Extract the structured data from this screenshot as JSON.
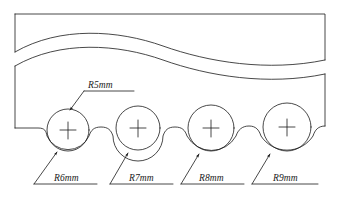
{
  "drawing": {
    "title": "Scalloped wave band radius callout drawing",
    "type": "engineering-line-drawing",
    "background_color": "#ffffff",
    "line_color": "#1a1a1a",
    "line_width": 0.8,
    "canvas": {
      "width": 340,
      "height": 204
    }
  },
  "annotations": [
    {
      "id": "r5",
      "label_prefix": "R",
      "label_value": "5",
      "label_unit": "mm",
      "label": "R5mm",
      "text_x": 88,
      "text_y": 88,
      "underline": {
        "x1": 84,
        "y1": 91,
        "x2": 134,
        "y2": 91
      },
      "leader": {
        "x1": 84,
        "y1": 91,
        "x2": 70,
        "y2": 108
      },
      "arrow": {
        "x": 70,
        "y": 108,
        "angle": 230
      },
      "points_to": "construction-circle-1"
    },
    {
      "id": "r6",
      "label_prefix": "R",
      "label_value": "6",
      "label_unit": "mm",
      "label": "R6mm",
      "text_x": 54,
      "text_y": 180,
      "underline": {
        "x1": 34,
        "y1": 184,
        "x2": 97,
        "y2": 184
      },
      "leader": {
        "x1": 34,
        "y1": 184,
        "x2": 57,
        "y2": 153
      },
      "arrow": {
        "x": 57,
        "y": 153,
        "angle": 307
      },
      "points_to": "scallop-arc-1"
    },
    {
      "id": "r7",
      "label_prefix": "R",
      "label_value": "7",
      "label_unit": "mm",
      "label": "R7mm",
      "text_x": 129,
      "text_y": 180,
      "underline": {
        "x1": 110,
        "y1": 184,
        "x2": 173,
        "y2": 184
      },
      "leader": {
        "x1": 110,
        "y1": 184,
        "x2": 128,
        "y2": 154
      },
      "arrow": {
        "x": 128,
        "y": 154,
        "angle": 301
      },
      "points_to": "scallop-arc-2"
    },
    {
      "id": "r8",
      "label_prefix": "R",
      "label_value": "8",
      "label_unit": "mm",
      "label": "R8mm",
      "text_x": 199,
      "text_y": 180,
      "underline": {
        "x1": 181,
        "y1": 184,
        "x2": 244,
        "y2": 184
      },
      "leader": {
        "x1": 181,
        "y1": 184,
        "x2": 197,
        "y2": 155
      },
      "arrow": {
        "x": 197,
        "y": 155,
        "angle": 299
      },
      "points_to": "scallop-arc-3"
    },
    {
      "id": "r9",
      "label_prefix": "R",
      "label_value": "9",
      "label_unit": "mm",
      "label": "R9mm",
      "text_x": 273,
      "text_y": 180,
      "underline": {
        "x1": 252,
        "y1": 184,
        "x2": 318,
        "y2": 184
      },
      "leader": {
        "x1": 252,
        "y1": 184,
        "x2": 268,
        "y2": 155
      },
      "arrow": {
        "x": 268,
        "y": 155,
        "angle": 299
      },
      "points_to": "scallop-arc-4"
    }
  ],
  "teeth": [
    {
      "id": 1,
      "center_x": 68,
      "center_y": 130,
      "circle_r": 21,
      "scallop_r": 23,
      "cross_size": 12
    },
    {
      "id": 2,
      "center_x": 138,
      "center_y": 129,
      "circle_r": 22,
      "scallop_r": 25,
      "cross_size": 12
    },
    {
      "id": 3,
      "center_x": 208,
      "center_y": 129,
      "circle_r": 24,
      "scallop_r": 28,
      "cross_size": 13
    },
    {
      "id": 4,
      "center_x": 282,
      "center_y": 128,
      "circle_r": 25,
      "scallop_r": 31,
      "cross_size": 13
    }
  ],
  "geometry": {
    "upper_band_top": "M 14 20 L 326 20 L 326 62",
    "upper_band_left": "M 14 20 L 14 53",
    "outline_note": "wavy band with four bottom scallops"
  }
}
